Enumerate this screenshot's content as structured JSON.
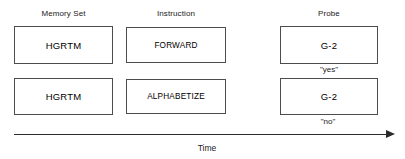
{
  "figure": {
    "title": "",
    "columns": [
      {
        "id": "memory-set",
        "label": "Memory Set"
      },
      {
        "id": "instruction",
        "label": "Instruction"
      },
      {
        "id": "probe",
        "label": "Probe"
      }
    ],
    "trials": [
      {
        "id": "trial-1",
        "memory_set": "HGRTM",
        "instruction": "FORWARD",
        "probe": "G-2",
        "response": "\"yes\""
      },
      {
        "id": "trial-2",
        "memory_set": "HGRTM",
        "instruction": "ALPHABETIZE",
        "probe": "G-2",
        "response": "\"no\""
      }
    ],
    "axis": {
      "label": "Time",
      "direction": "left-to-right",
      "arrow_icon": "arrow-right-icon"
    },
    "colors": {
      "background": "#ffffff",
      "box_border": "#4c4c4c",
      "text": "#000000",
      "label_text": "#1a1a1a",
      "axis": "#2b2b2b"
    }
  }
}
